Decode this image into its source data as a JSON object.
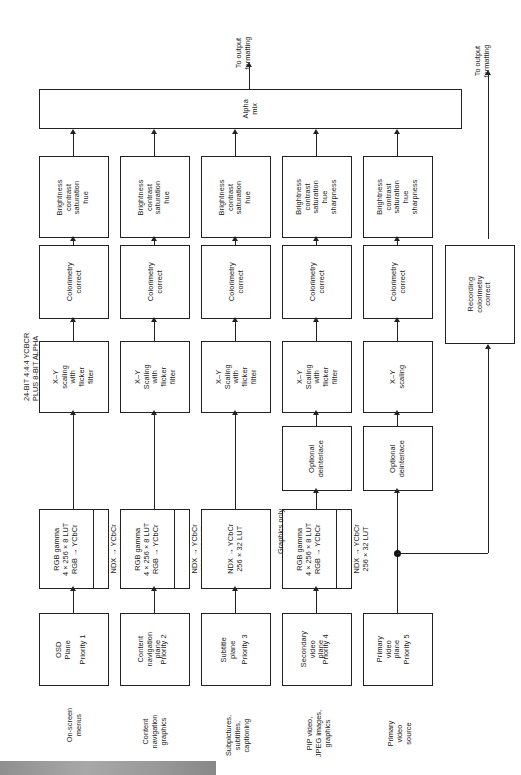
{
  "diagram": {
    "orientation": "rotated-90",
    "bus_label": "24-BIT 4:4:4 YCBCR\nPLUS 8-BIT ALPHA",
    "bus_label_line1": "24-BIT 4:4:4 YCBCR",
    "bus_label_line2": "PLUS 8-BIT ALPHA",
    "alpha_mix": "Alpha\nmix",
    "alpha_mix_line1": "Alpha",
    "alpha_mix_line2": "mix",
    "output_main": "To output\nformatting",
    "output_main_line1": "To output",
    "output_main_line2": "formatting",
    "output_record": "To output\nformatting",
    "output_record_line1": "To output",
    "output_record_line2": "formatting",
    "graphics_only": "Graphics only",
    "recording_block": "Recording\ncolorimetry\ncorrect",
    "recording_block_line1": "Recording",
    "recording_block_line2": "colorimetry",
    "recording_block_line3": "correct",
    "deinterlace": "Optional\ndeinterlace",
    "deinterlace_line1": "Optional",
    "deinterlace_line2": "deinterlace",
    "colorimetry": "Colorimetry\ncorrect",
    "colorimetry_line1": "Colorimetry",
    "colorimetry_line2": "correct"
  },
  "columns": [
    {
      "id": "col1",
      "source_label_line1": "On-screen",
      "source_label_line2": "menus",
      "source_label_line3": "",
      "plane_name_line1": "OSD",
      "plane_name_line2": "Plane",
      "plane_name_line3": "",
      "priority": "Priority 1",
      "lut_a_line1": "RGB gamma",
      "lut_a_line2": "4 × 256 × 8 LUT",
      "lut_a_line3": "RGB → YCbCr",
      "lut_b_line1": "NDX → YCbCr",
      "lut_b_line2": "256 × 32 LUT",
      "has_lut_a": true,
      "has_lut_b": true,
      "has_deinterlace": false,
      "scaling_line1": "X–Y",
      "scaling_line2": "scaling",
      "scaling_line3": "with",
      "scaling_line4": "flicker",
      "scaling_line5": "filter",
      "colorimetry_line1": "Colorimetry",
      "colorimetry_line2": "correct",
      "adjust_line1": "Brightness",
      "adjust_line2": "contrast",
      "adjust_line3": "saturation",
      "adjust_line4": "hue",
      "adjust_line5": ""
    },
    {
      "id": "col2",
      "source_label_line1": "Content",
      "source_label_line2": "navigation",
      "source_label_line3": "graphics",
      "plane_name_line1": "Content",
      "plane_name_line2": "navigation",
      "plane_name_line3": "plane",
      "priority": "Priority 2",
      "lut_a_line1": "RGB gamma",
      "lut_a_line2": "4 × 256 × 8 LUT",
      "lut_a_line3": "RGB → YCbCr",
      "lut_b_line1": "NDX → YCbCr",
      "lut_b_line2": "256 × 32 LUT",
      "has_lut_a": true,
      "has_lut_b": true,
      "has_deinterlace": false,
      "scaling_line1": "X–Y",
      "scaling_line2": "Scaling",
      "scaling_line3": "with",
      "scaling_line4": "flicker",
      "scaling_line5": "filter",
      "colorimetry_line1": "Colorimetry",
      "colorimetry_line2": "correct",
      "adjust_line1": "Brightness",
      "adjust_line2": "contrast",
      "adjust_line3": "saturation",
      "adjust_line4": "hue",
      "adjust_line5": ""
    },
    {
      "id": "col3",
      "source_label_line1": "Subpictures,",
      "source_label_line2": "subtitles,",
      "source_label_line3": "captioning",
      "plane_name_line1": "Subtitle",
      "plane_name_line2": "plane",
      "plane_name_line3": "",
      "priority": "Priority 3",
      "lut_a_line1": "",
      "lut_a_line2": "",
      "lut_a_line3": "",
      "lut_b_line1": "NDX → YCbCr",
      "lut_b_line2": "256 × 32 LUT",
      "has_lut_a": false,
      "has_lut_b": true,
      "has_deinterlace": false,
      "scaling_line1": "X–Y",
      "scaling_line2": "Scaling",
      "scaling_line3": "with",
      "scaling_line4": "flicker",
      "scaling_line5": "filter",
      "colorimetry_line1": "Colorimetry",
      "colorimetry_line2": "correct",
      "adjust_line1": "Brightness",
      "adjust_line2": "contrast",
      "adjust_line3": "saturation",
      "adjust_line4": "hue",
      "adjust_line5": ""
    },
    {
      "id": "col4",
      "source_label_line1": "PIP video,",
      "source_label_line2": "JPEG images,",
      "source_label_line3": "graphics",
      "plane_name_line1": "Secondary",
      "plane_name_line2": "video",
      "plane_name_line3": "plane",
      "priority": "Priority 4",
      "lut_a_line1": "RGB gamma",
      "lut_a_line2": "4 × 256 × 8 LUT",
      "lut_a_line3": "RGB → YCbCr",
      "lut_b_line1": "NDX → YCbCr",
      "lut_b_line2": "256 × 32 LUT",
      "has_lut_a": true,
      "has_lut_b": true,
      "has_deinterlace": true,
      "scaling_line1": "X–Y",
      "scaling_line2": "Scaling",
      "scaling_line3": "with",
      "scaling_line4": "flicker",
      "scaling_line5": "filter",
      "colorimetry_line1": "Colorimetry",
      "colorimetry_line2": "correct",
      "adjust_line1": "Brightness",
      "adjust_line2": "contrast",
      "adjust_line3": "saturation",
      "adjust_line4": "hue",
      "adjust_line5": "sharpness"
    },
    {
      "id": "col5",
      "source_label_line1": "Primary",
      "source_label_line2": "video",
      "source_label_line3": "source",
      "plane_name_line1": "Primary",
      "plane_name_line2": "video",
      "plane_name_line3": "plane",
      "priority": "Priority 5",
      "lut_a_line1": "",
      "lut_a_line2": "",
      "lut_a_line3": "",
      "lut_b_line1": "",
      "lut_b_line2": "",
      "has_lut_a": false,
      "has_lut_b": false,
      "has_deinterlace": true,
      "scaling_line1": "X–Y",
      "scaling_line2": "scaling",
      "scaling_line3": "",
      "scaling_line4": "",
      "scaling_line5": "",
      "colorimetry_line1": "Colorimetry",
      "colorimetry_line2": "correct",
      "adjust_line1": "Brightness",
      "adjust_line2": "contrast",
      "adjust_line3": "saturation",
      "adjust_line4": "hue",
      "adjust_line5": "sharpness"
    }
  ]
}
